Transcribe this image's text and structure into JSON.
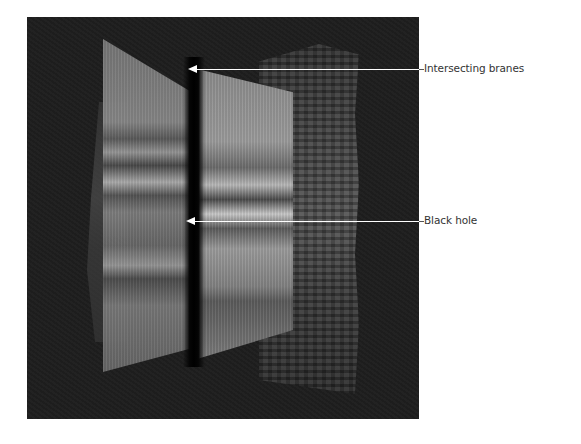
{
  "figure": {
    "colors": {
      "background": "#ffffff",
      "panel": "#1e1e1e",
      "leader_line": "#ffffff",
      "label_text": "#333333"
    },
    "annotations": [
      {
        "label": "Intersecting branes",
        "target": "brane-intersection-top"
      },
      {
        "label": "Black hole",
        "target": "black-hole-center"
      }
    ]
  }
}
